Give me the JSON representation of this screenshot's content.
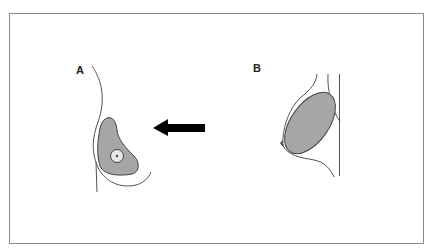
{
  "figure": {
    "panels": [
      {
        "label": "A",
        "view": "frontal"
      },
      {
        "label": "B",
        "view": "lateral"
      }
    ],
    "arrow": {
      "direction": "left",
      "color": "#000000"
    },
    "colors": {
      "frame": "#8a8a8a",
      "outline": "#555555",
      "fill": "#a6a6a6",
      "areola_fill": "#e6e6e6"
    }
  }
}
